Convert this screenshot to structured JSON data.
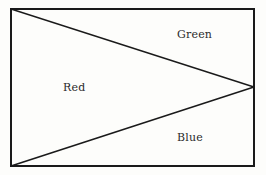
{
  "figure": {
    "kind": "geometric-diagram",
    "background_color": "#fdfdfb",
    "stroke_color": "#1a1a1a",
    "stroke_width": 1.5,
    "canvas": {
      "width": 266,
      "height": 175
    },
    "rectangle": {
      "name": "outer-rectangle",
      "left": 11,
      "top": 9,
      "right": 254,
      "bottom": 166
    },
    "apex": {
      "x": 254,
      "y": 87
    },
    "lines": [
      {
        "name": "upper-diagonal",
        "from": {
          "x": 11,
          "y": 9
        },
        "to": {
          "x": 254,
          "y": 87
        }
      },
      {
        "name": "lower-diagonal",
        "from": {
          "x": 11,
          "y": 166
        },
        "to": {
          "x": 254,
          "y": 87
        }
      }
    ],
    "regions": [
      {
        "name": "green-region",
        "label": "Green",
        "label_x": 177,
        "label_y": 29,
        "vertices": [
          {
            "x": 11,
            "y": 9
          },
          {
            "x": 254,
            "y": 9
          },
          {
            "x": 254,
            "y": 87
          }
        ]
      },
      {
        "name": "red-region",
        "label": "Red",
        "label_x": 63,
        "label_y": 82,
        "vertices": [
          {
            "x": 11,
            "y": 9
          },
          {
            "x": 254,
            "y": 87
          },
          {
            "x": 11,
            "y": 166
          }
        ]
      },
      {
        "name": "blue-region",
        "label": "Blue",
        "label_x": 177,
        "label_y": 132,
        "vertices": [
          {
            "x": 11,
            "y": 166
          },
          {
            "x": 254,
            "y": 87
          },
          {
            "x": 254,
            "y": 166
          }
        ]
      }
    ],
    "label_text_color": "#2b2b2b",
    "label_font_size": 11
  }
}
